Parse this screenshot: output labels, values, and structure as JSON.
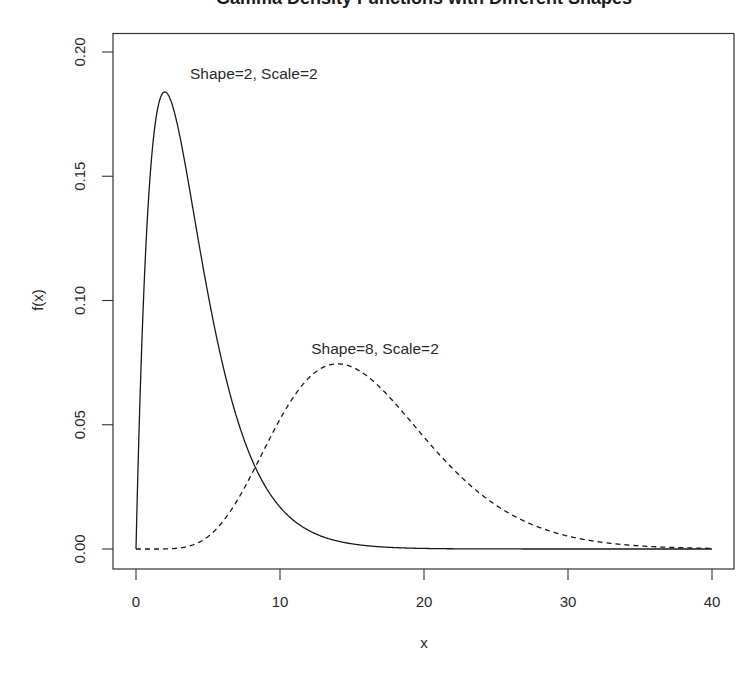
{
  "chart_data": {
    "type": "line",
    "title": "Gamma Density Functions with Different Shapes",
    "title_visible": "cut off at top of image (only descenders visible)",
    "xlabel": "x",
    "ylabel": "f(x)",
    "xlim": [
      0,
      40
    ],
    "ylim": [
      0,
      0.2
    ],
    "grid": false,
    "legend": "none (inline text annotations)",
    "x_ticks": [
      "0",
      "10",
      "20",
      "30",
      "40"
    ],
    "y_ticks": [
      "0.00",
      "0.05",
      "0.10",
      "0.15",
      "0.20"
    ],
    "series": [
      {
        "name": "Shape=2, Scale=2",
        "shape": 2,
        "scale": 2,
        "line_style": "solid",
        "color": "#1a1a1a",
        "x": [
          0,
          1,
          2,
          3,
          4,
          5,
          6,
          8,
          10,
          12,
          15,
          20,
          30,
          40
        ],
        "values": [
          0.0,
          0.1516,
          0.1839,
          0.1673,
          0.1353,
          0.1026,
          0.0747,
          0.0366,
          0.0168,
          0.0074,
          0.0021,
          0.0002,
          0.0,
          0.0
        ]
      },
      {
        "name": "Shape=8, Scale=2",
        "shape": 8,
        "scale": 2,
        "line_style": "dashed",
        "color": "#1a1a1a",
        "x": [
          0,
          4,
          6,
          8,
          10,
          12,
          14,
          16,
          18,
          20,
          25,
          30,
          35,
          40
        ],
        "values": [
          0.0,
          0.0017,
          0.0108,
          0.0298,
          0.0522,
          0.0688,
          0.0745,
          0.0698,
          0.0586,
          0.0451,
          0.0176,
          0.0052,
          0.0013,
          0.0003
        ]
      }
    ],
    "annotations": [
      {
        "text": "Shape=2, Scale=2",
        "x": 3.8,
        "y": 0.181
      },
      {
        "text": "Shape=8, Scale=2",
        "x": 16.6,
        "y": 0.081
      }
    ]
  },
  "labels": {
    "title": "Gamma Density Functions with Different Shapes",
    "xlabel": "x",
    "ylabel": "f(x)",
    "annot1": "Shape=2, Scale=2",
    "annot2": "Shape=8, Scale=2",
    "xtick0": "0",
    "xtick1": "10",
    "xtick2": "20",
    "xtick3": "30",
    "xtick4": "40",
    "ytick0": "0.00",
    "ytick1": "0.05",
    "ytick2": "0.10",
    "ytick3": "0.15",
    "ytick4": "0.20"
  },
  "colors": {
    "line": "#1a1a1a",
    "frame": "#333333",
    "background": "#ffffff"
  }
}
